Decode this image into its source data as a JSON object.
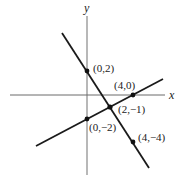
{
  "diagram": {
    "type": "coordinate-plane-two-lines",
    "axes": {
      "x_label": "x",
      "y_label": "y",
      "axis_color": "#999999"
    },
    "lines": [
      {
        "name": "line-through-0-2-and-4-neg4",
        "color": "#1a1a1a",
        "points": [
          "(0,2)",
          "(2,−1)",
          "(4,−4)"
        ]
      },
      {
        "name": "line-through-0-neg2-and-4-0",
        "color": "#1a1a1a",
        "points": [
          "(0,−2)",
          "(2,−1)",
          "(4,0)"
        ]
      }
    ],
    "points": [
      {
        "label": "(0,2)",
        "x": 0,
        "y": 2
      },
      {
        "label": "(4,0)",
        "x": 4,
        "y": 0
      },
      {
        "label": "(2,−1)",
        "x": 2,
        "y": -1
      },
      {
        "label": "(0,−2)",
        "x": 0,
        "y": -2
      },
      {
        "label": "(4,−4)",
        "x": 4,
        "y": -4
      }
    ],
    "intersection": {
      "label": "(2,−1)",
      "x": 2,
      "y": -1
    }
  }
}
